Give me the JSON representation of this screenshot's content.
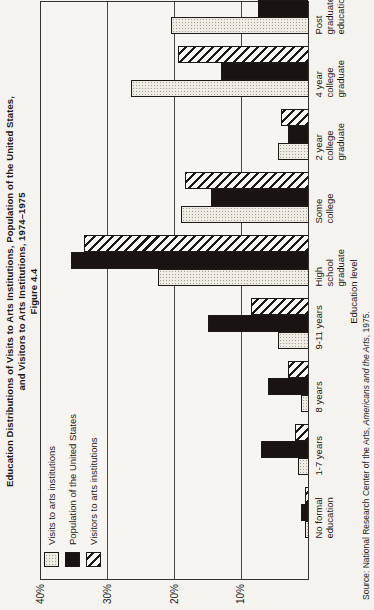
{
  "page": {
    "paper_color": "#f5f3ef",
    "ink_color": "#1c1813"
  },
  "chart_data": {
    "type": "bar",
    "orientation": "landscape chart rotated 90deg counterclockwise on portrait page",
    "figure_label": "Figure 4.4",
    "caption_line1": "Education Distributions of Visits to Arts Institutions, Population of the United States,",
    "caption_line2": "and Visitors to Arts Institutions, 1974–1975",
    "xlabel": "Education level",
    "ylabel": "",
    "ylim": [
      0,
      40
    ],
    "yticks": [
      {
        "value": 10,
        "label": "10%"
      },
      {
        "value": 20,
        "label": "20%"
      },
      {
        "value": 30,
        "label": "30%"
      },
      {
        "value": 40,
        "label": "40%"
      }
    ],
    "grid": "horizontal gridlines at 10/20/30; 40% line is plot top border",
    "legend_position": "top-left inside plot, no border",
    "categories": [
      {
        "label": "No formal education",
        "lines": [
          "No formal",
          "education"
        ]
      },
      {
        "label": "1-7 years",
        "lines": [
          "1-7 years"
        ]
      },
      {
        "label": "8 years",
        "lines": [
          "8 years"
        ]
      },
      {
        "label": "9-11 years",
        "lines": [
          "9-11 years"
        ]
      },
      {
        "label": "High school graduate",
        "lines": [
          "High",
          "school",
          "graduate"
        ]
      },
      {
        "label": "Some college",
        "lines": [
          "Some",
          "college"
        ]
      },
      {
        "label": "2 year college graduate",
        "lines": [
          "2 year",
          "college",
          "graduate"
        ]
      },
      {
        "label": "4 year college graduate",
        "lines": [
          "4 year",
          "college",
          "graduate"
        ]
      },
      {
        "label": "Post graduate education",
        "lines": [
          "Post",
          "graduate",
          "education"
        ]
      }
    ],
    "series": [
      {
        "name": "Visits to arts institutions",
        "pattern": "stipple",
        "css": "fill-stipple",
        "values": [
          0.5,
          1.5,
          1,
          4.5,
          22.5,
          19,
          4.5,
          26.5,
          20.5
        ]
      },
      {
        "name": "Population of the United States",
        "pattern": "solid-black",
        "css": "fill-solid",
        "values": [
          1,
          7,
          6,
          15,
          35.5,
          14.5,
          3,
          13,
          7.5
        ]
      },
      {
        "name": "Visitors to arts institutions",
        "pattern": "diagonal-hatch",
        "css": "fill-hatch",
        "values": [
          0.5,
          2,
          3,
          8.5,
          33.5,
          18.5,
          4,
          19.5,
          11
        ]
      }
    ],
    "source": {
      "prefix": "Source:  National Research Center of the Arts, ",
      "italic": "Americans and the Arts",
      "suffix": ", 1975."
    }
  }
}
